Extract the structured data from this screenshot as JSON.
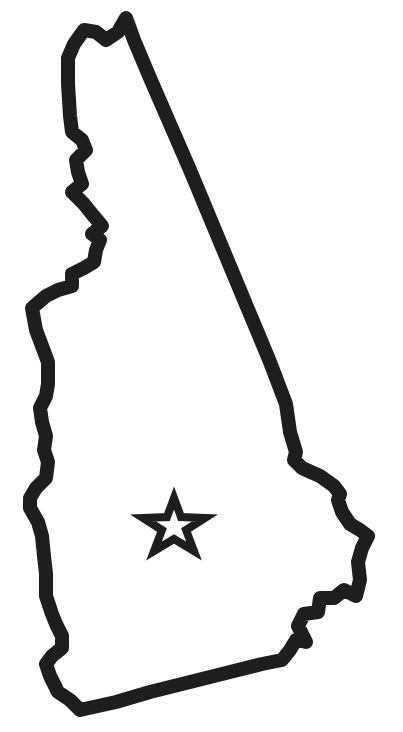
{
  "map": {
    "subject": "New Hampshire state outline",
    "style": "outline",
    "background_color": "#ffffff",
    "stroke_color": "#1e1e1e",
    "stroke_width": 14,
    "markers": [
      {
        "type": "star",
        "meaning": "state capital",
        "center_x": 174,
        "center_y": 528
      }
    ]
  }
}
